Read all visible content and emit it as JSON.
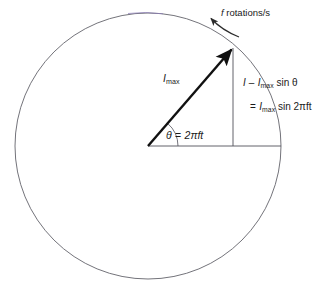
{
  "figure": {
    "background_color": "#ffffff",
    "line_color": "#5a5a62",
    "vector_color": "#111111",
    "text_color": "#1a1a1a",
    "circle_tint_color": "#8e7fb8"
  },
  "geometry": {
    "center_x": 148,
    "center_y": 146,
    "radius": 133,
    "vector_tip_x": 233,
    "vector_tip_y": 47,
    "angle_degrees": 49,
    "baseline_end_x": 281
  },
  "labels": {
    "rotation_rate": {
      "italic_symbol": "f",
      "text": " rotations/s",
      "full": "f rotations/s"
    },
    "vector_magnitude": {
      "symbol": "I",
      "subscript": "max",
      "full": "Imax"
    },
    "angle": {
      "symbol": "θ",
      "equals": " =  ",
      "value": "2πft",
      "full": "θ = 2πft"
    },
    "equation_line_1": {
      "lhs": "I",
      "equals": "  –  ",
      "rhs_symbol": "I",
      "rhs_subscript": "max",
      "rhs_rest": " sin θ",
      "full": "I = Imax sin θ"
    },
    "equation_line_2": {
      "equals": "=  ",
      "rhs_symbol": "I",
      "rhs_subscript": "max",
      "rhs_rest": " sin 2πft",
      "full": "= Imax sin 2πft"
    }
  },
  "icons": {
    "rotation_arrow": "curved-arrow-counterclockwise-icon",
    "phasor_arrow": "vector-arrow-icon",
    "angle_arc": "angle-arc-icon"
  }
}
